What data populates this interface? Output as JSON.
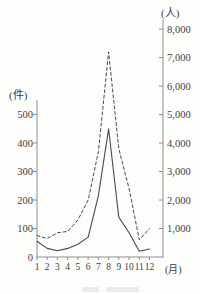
{
  "figure": {
    "background": "#fdfdfb",
    "line_color": "#4a4a4a",
    "axis_color": "#8f8f8f",
    "text_color": "#3d3d3d"
  },
  "chart_data": {
    "type": "line",
    "x": [
      1,
      2,
      3,
      4,
      5,
      6,
      7,
      8,
      9,
      10,
      11,
      12
    ],
    "x_label": "(月)",
    "series": [
      {
        "name": "solid-line-cases",
        "style": "solid",
        "axis": "left",
        "unit": "件",
        "values": [
          55,
          30,
          22,
          30,
          45,
          70,
          215,
          450,
          140,
          85,
          20,
          28
        ]
      },
      {
        "name": "dashed-line-persons",
        "style": "dashed",
        "axis": "right",
        "unit": "人",
        "values": [
          750,
          650,
          850,
          900,
          1300,
          2000,
          3700,
          7200,
          3800,
          2400,
          600,
          1000
        ]
      }
    ],
    "left_axis": {
      "title": "(件)",
      "ticks": [
        0,
        100,
        200,
        300,
        400,
        500
      ],
      "tick_labels": [
        "0",
        "100",
        "200",
        "300",
        "400",
        "500"
      ],
      "range": [
        0,
        560
      ]
    },
    "right_axis": {
      "title": "(人)",
      "ticks": [
        1000,
        2000,
        3000,
        4000,
        5000,
        6000,
        7000,
        8000
      ],
      "tick_labels": [
        "1,000",
        "2,000",
        "3,000",
        "4,000",
        "5,000",
        "6,000",
        "7,000",
        "8,000"
      ],
      "range": [
        0,
        8300
      ]
    },
    "grid": false,
    "legend": "none"
  }
}
